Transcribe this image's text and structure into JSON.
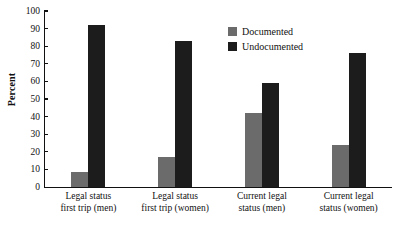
{
  "chart_data": {
    "type": "bar",
    "title": "",
    "subtitle": "",
    "xlabel": "",
    "ylabel": "Percent",
    "ylim": [
      0,
      100
    ],
    "yticks": [
      0,
      10,
      20,
      30,
      40,
      50,
      60,
      70,
      80,
      90,
      100
    ],
    "ytick_labels": [
      "0",
      "10",
      "20",
      "30",
      "40",
      "50",
      "60",
      "70",
      "80",
      "90",
      "100"
    ],
    "grid": false,
    "legend_position": "top-right-inside",
    "categories": [
      "Legal status first trip (men)",
      "Legal status first trip (women)",
      "Current legal status (men)",
      "Current legal status (women)"
    ],
    "category_lines": [
      [
        "Legal status",
        "first trip (men)"
      ],
      [
        "Legal status",
        "first trip (women)"
      ],
      [
        "Current legal",
        "status (men)"
      ],
      [
        "Current legal",
        "status (women)"
      ]
    ],
    "series": [
      {
        "name": "Documented",
        "color": "#6b6b6b",
        "values": [
          8.5,
          17,
          42,
          24
        ]
      },
      {
        "name": "Undocumented",
        "color": "#1c1c1c",
        "values": [
          92,
          83,
          59,
          76
        ]
      }
    ]
  },
  "legend": {
    "entries": [
      {
        "label": "Documented",
        "swatch": "documented"
      },
      {
        "label": "Undocumented",
        "swatch": "undocumented"
      }
    ]
  },
  "axes": {
    "y_title": "Percent"
  }
}
